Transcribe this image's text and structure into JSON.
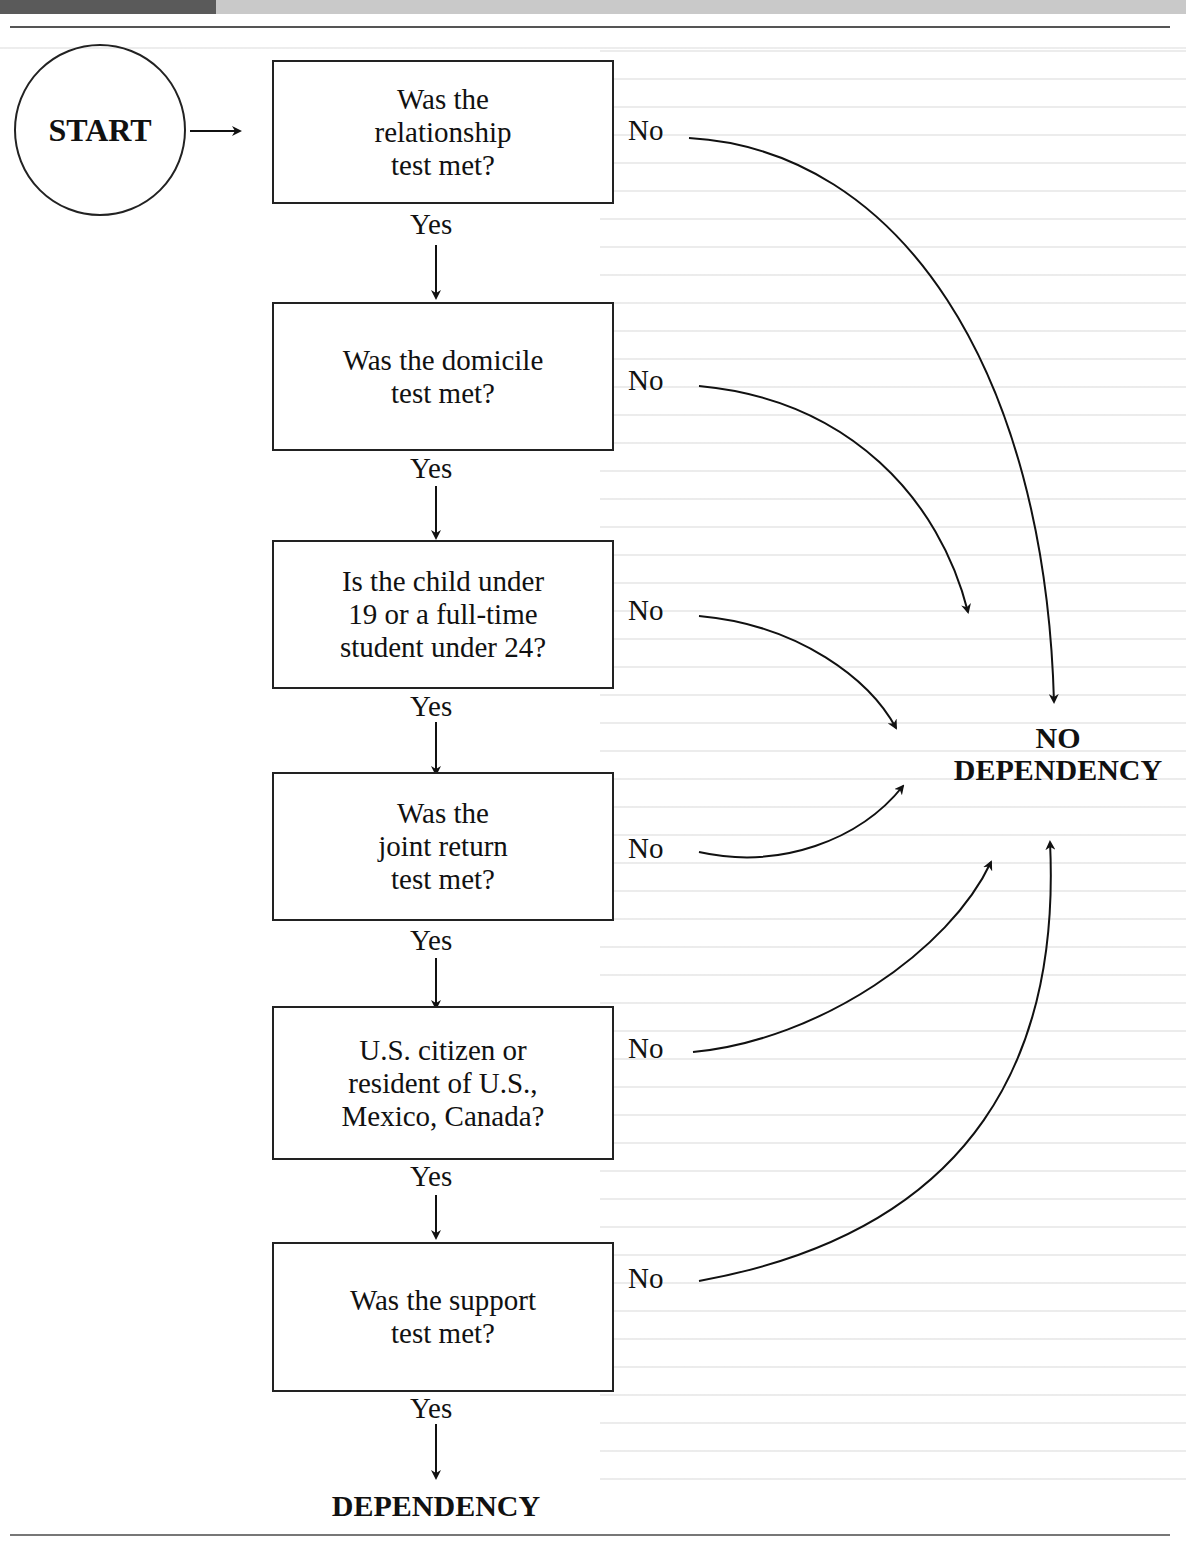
{
  "flowchart": {
    "start": {
      "label": "START"
    },
    "steps": [
      {
        "question": "Was the\nrelationship\ntest met?",
        "yes_label": "Yes",
        "no_label": "No"
      },
      {
        "question": "Was the domicile\ntest met?",
        "yes_label": "Yes",
        "no_label": "No"
      },
      {
        "question": "Is the child under\n19 or a full-time\nstudent under 24?",
        "yes_label": "Yes",
        "no_label": "No"
      },
      {
        "question": "Was the\njoint return\ntest met?",
        "yes_label": "Yes",
        "no_label": "No"
      },
      {
        "question": "U.S. citizen or\nresident of U.S.,\nMexico, Canada?",
        "yes_label": "Yes",
        "no_label": "No"
      },
      {
        "question": "Was the support\ntest met?",
        "yes_label": "Yes",
        "no_label": "No"
      }
    ],
    "outcomes": {
      "no": {
        "line1": "NO",
        "line2": "DEPENDENCY"
      },
      "yes": {
        "label": "DEPENDENCY"
      }
    }
  },
  "colors": {
    "ink": "#111111",
    "rule": "#555555",
    "header_dark": "#5a5a5a",
    "header_light": "#c9c9c9"
  }
}
